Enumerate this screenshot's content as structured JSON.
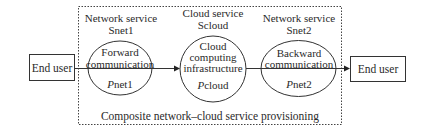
{
  "diagram": {
    "title": "Composite network–cloud service provisioning",
    "nodes": {
      "end_user_left": {
        "label": "End user"
      },
      "end_user_right": {
        "label": "End user"
      },
      "network_service_1": {
        "heading": "Network service",
        "name": "Snet1",
        "inner_line1": "Forward",
        "inner_line2": "communication",
        "param_prefix": "P",
        "param_suffix": "net1"
      },
      "cloud_service": {
        "heading": "Cloud service",
        "name": "Scloud",
        "inner_line1": "Cloud",
        "inner_line2": "computing",
        "inner_line3": "infrastructure",
        "param_prefix": "P",
        "param_suffix": "cloud"
      },
      "network_service_2": {
        "heading": "Network service",
        "name": "Snet2",
        "inner_line1": "Backward",
        "inner_line2": "communication",
        "param_prefix": "P",
        "param_suffix": "net2"
      }
    },
    "edges": [
      {
        "from": "end_user_left",
        "to": "cloud_service",
        "via": "network_service_1",
        "arrow": "end"
      },
      {
        "from": "cloud_service",
        "to": "end_user_right",
        "via": "network_service_2",
        "arrow": "end"
      }
    ],
    "colors": {
      "stroke": "#333333",
      "text": "#2a2a2a",
      "background": "#ffffff"
    }
  }
}
